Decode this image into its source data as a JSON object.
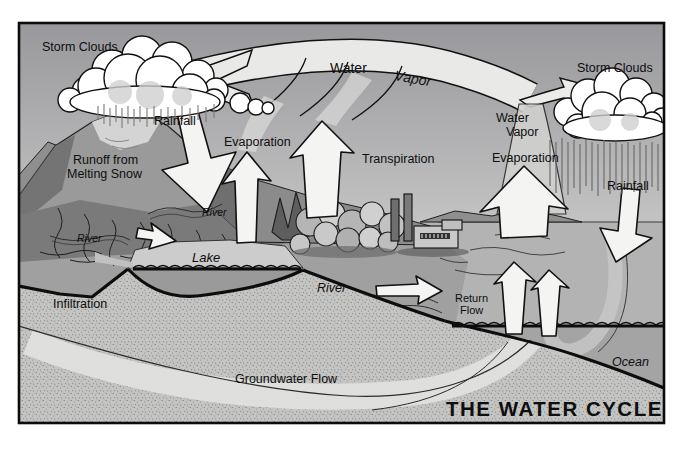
{
  "figure": {
    "title": "THE WATER CYCLE",
    "type": "water-cycle-illustration"
  },
  "labels": {
    "storm_clouds_left": "Storm Clouds",
    "storm_clouds_right": "Storm Clouds",
    "water_vapor_arc": {
      "water": "Water",
      "vapor": "Vapor"
    },
    "rainfall_left": "Rainfall",
    "rainfall_right": "Rainfall",
    "evaporation_left": "Evaporation",
    "evaporation_right": "Evaporation",
    "transpiration": "Transpiration",
    "water_vapor_right": {
      "line1": "Water",
      "line2": "Vapor"
    },
    "runoff": {
      "line1": "Runoff from",
      "line2": "Melting Snow"
    },
    "river_upper": "River",
    "river_left": "River",
    "river_center": "River",
    "lake": "Lake",
    "return_flow": {
      "line1": "Return",
      "line2": "Flow"
    },
    "infiltration": "Infiltration",
    "groundwater_flow": "Groundwater Flow",
    "ocean": "Ocean"
  },
  "colors": {
    "paper": "#ffffff",
    "ink": "#0e0e0e",
    "sky_top": "#98989c",
    "sky_horizon": "#c7c7c7",
    "arrow_fill": "#f4f4f2",
    "arc_fill": "#e9e9e7",
    "ground_stipple_base": "#c4c4c2",
    "ocean_fill": "#a4a4a4"
  }
}
